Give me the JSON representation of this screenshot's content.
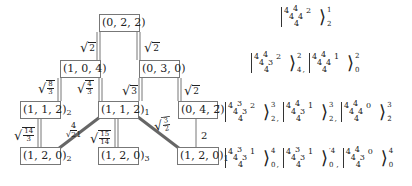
{
  "nodes": [
    {
      "id": "n022",
      "label": "(0, 2, 2)",
      "sub": ""
    },
    {
      "id": "n104",
      "label": "(1, 0, 4)",
      "sub": ""
    },
    {
      "id": "n030",
      "label": "(0, 3, 0)",
      "sub": ""
    },
    {
      "id": "n112b",
      "label": "(1, 1, 2)",
      "sub": "2"
    },
    {
      "id": "n112a",
      "label": "(1, 1, 2)",
      "sub": "1"
    },
    {
      "id": "n04b2",
      "label": "(0, 4, 2̄)",
      "sub": ""
    },
    {
      "id": "n120b",
      "label": "(1, 2, 0)",
      "sub": "2"
    },
    {
      "id": "n120c",
      "label": "(1, 2, 0)",
      "sub": "3"
    },
    {
      "id": "n120a",
      "label": "(1, 2, 0)",
      "sub": "1"
    }
  ],
  "edges": [
    {
      "from": "(0,2,2)",
      "to": "(1,0,4)",
      "weight": "√2"
    },
    {
      "from": "(0,2,2)",
      "to": "(0,3,0)",
      "weight": "√2"
    },
    {
      "from": "(1,0,4)",
      "to": "(1,1,2)_2",
      "weight": "√(8/3)"
    },
    {
      "from": "(1,0,4)",
      "to": "(1,1,2)_1",
      "weight": "√(4/3)"
    },
    {
      "from": "(0,3,0)",
      "to": "(1,1,2)_1",
      "weight": "√3"
    },
    {
      "from": "(0,3,0)",
      "to": "(0,4,2̄)",
      "weight": "√2"
    },
    {
      "from": "(1,1,2)_2",
      "to": "(1,2,0)_2",
      "weight": "√(14/3)"
    },
    {
      "from": "(1,1,2)_1",
      "to": "(1,2,0)_2",
      "weight": "4/√21"
    },
    {
      "from": "(1,1,2)_1",
      "to": "(1,2,0)_3",
      "weight": "√(15/14)"
    },
    {
      "from": "(1,1,2)_1",
      "to": "(1,2,0)_1",
      "weight": "√(3/2)"
    },
    {
      "from": "(0,4,2̄)",
      "to": "(1,2,0)_1",
      "weight": "2"
    }
  ],
  "labels": {
    "e1": {
      "rad": "√",
      "under": "2"
    },
    "e2": {
      "rad": "√",
      "under": "2"
    },
    "e3": {
      "num": "8",
      "den": "3"
    },
    "e4": {
      "num": "4",
      "den": "3"
    },
    "e5": {
      "rad": "√",
      "under": "3"
    },
    "e6": {
      "rad": "√",
      "under": "2"
    },
    "e7": {
      "num": "14",
      "den": "3"
    },
    "e8": {
      "num": "4",
      "den": "√21"
    },
    "e9": {
      "num": "15",
      "den": "14"
    },
    "e10": {
      "num": "3",
      "den": "2"
    },
    "e11": {
      "text": "2"
    }
  },
  "kets": [
    {
      "row": 0,
      "items": [
        {
          "tl": "4",
          "tm": "4",
          "ml": "4",
          "mr": "4",
          "tr": "2",
          "b": "4",
          "sup": "1",
          "sub": "2"
        }
      ]
    },
    {
      "row": 1,
      "items": [
        {
          "tl": "4",
          "tm": "4",
          "ml": "4",
          "mr": "3",
          "tr": "2",
          "b": "4",
          "sup": "2",
          "sub": "4"
        },
        {
          "tl": "4",
          "tm": "4",
          "ml": "4",
          "mr": "4",
          "tr": "1",
          "b": "4",
          "sup": "2",
          "sub": "0"
        }
      ]
    },
    {
      "row": 2,
      "items": [
        {
          "tl": "4",
          "tm": "3",
          "ml": "4",
          "mr": "3",
          "tr": "2",
          "b": "4",
          "sup": "3",
          "sub": "2"
        },
        {
          "tl": "4",
          "tm": "4",
          "ml": "4",
          "mr": "3",
          "tr": "1",
          "b": "4",
          "sup": "3",
          "sub": "2"
        },
        {
          "tl": "4",
          "tm": "4",
          "ml": "4",
          "mr": "4",
          "tr": "0",
          "b": "4",
          "sup": "3",
          "sub": "2̄"
        }
      ]
    },
    {
      "row": 3,
      "items": [
        {
          "tl": "4",
          "tm": "3",
          "ml": "4",
          "mr": "3",
          "tr": "1",
          "b": "4",
          "sup": "4",
          "sub": "0"
        },
        {
          "tl": "4",
          "tm": "3",
          "ml": "4",
          "mr": "3",
          "tr": "1",
          "b": "4",
          "sup": "′4",
          "sub": "0"
        },
        {
          "tl": "4",
          "tm": "4",
          "ml": "4",
          "mr": "3",
          "tr": "0",
          "b": "4",
          "sup": "4",
          "sub": "0"
        }
      ]
    }
  ],
  "separator": ","
}
